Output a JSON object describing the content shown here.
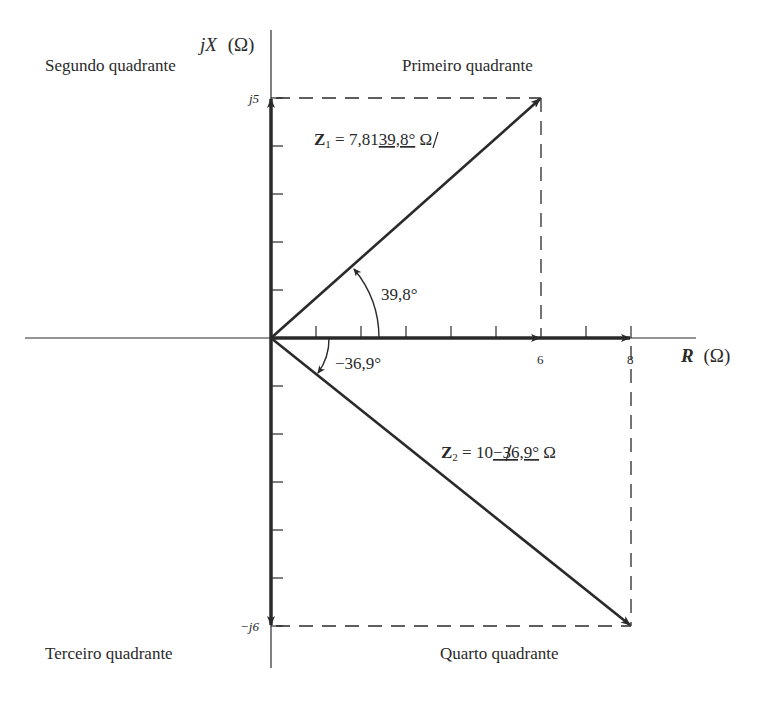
{
  "diagram": {
    "type": "impedance-plane-phasor-diagram",
    "quadrants": {
      "first": "Primeiro quadrante",
      "second": "Segundo quadrante",
      "third": "Terceiro quadrante",
      "fourth": "Quarto quadrante"
    },
    "axes": {
      "real_label": "R (Ω)",
      "real_label_var": "R",
      "real_label_unit": "(Ω)",
      "imag_label_var": "jX",
      "imag_label_unit": "(Ω)",
      "real_ticks": [
        "6",
        "8"
      ],
      "imag_ticks": [
        "j5",
        "−j6"
      ]
    },
    "phasors": [
      {
        "name": "Z1",
        "symbol": "Z",
        "subscript": "1",
        "equation_prefix": " = 7,81",
        "angle_text": "39,8°",
        "unit": " Ω",
        "R": 6,
        "X": 5,
        "magnitude": 7.81,
        "angle_deg": 39.8,
        "angle_label": "39,8°"
      },
      {
        "name": "Z2",
        "symbol": "Z",
        "subscript": "2",
        "equation_prefix": " = 10",
        "angle_text": "−36,9°",
        "unit": " Ω",
        "R": 8,
        "X": -6,
        "magnitude": 10,
        "angle_deg": -36.9,
        "angle_label": "−36,9°"
      }
    ]
  },
  "colors": {
    "ink": "#2a2a2a",
    "background": "#ffffff"
  }
}
